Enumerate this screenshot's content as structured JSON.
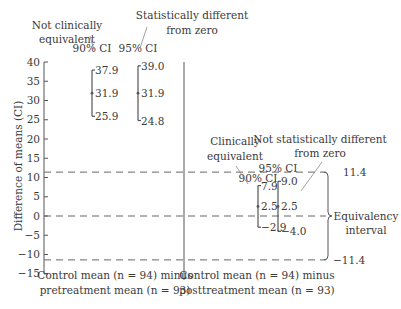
{
  "chart_data": {
    "type": "errorbar",
    "title": "",
    "xlabel": "",
    "ylabel": "Difference of means (CI)",
    "ylim": [
      -15,
      40
    ],
    "yticks": [
      40,
      35,
      30,
      25,
      20,
      15,
      10,
      5,
      0,
      -5,
      -10,
      -15
    ],
    "ytick_labels": [
      "40",
      "35",
      "30",
      "25",
      "20",
      "15",
      "10",
      "5",
      "0",
      "−5",
      "−10",
      "−15"
    ],
    "grid": false,
    "groups": [
      {
        "label_line1": "Control mean (n = 94) minus",
        "label_line2": "pretreatment mean (n = 93)",
        "intervals": [
          {
            "name": "90% CI",
            "upper": 37.9,
            "mean": 31.9,
            "lower": 25.9,
            "upper_label": "37.9",
            "mean_label": "31.9",
            "lower_label": "25.9"
          },
          {
            "name": "95% CI",
            "upper": 39.0,
            "mean": 31.9,
            "lower": 24.8,
            "upper_label": "39.0",
            "mean_label": "31.9",
            "lower_label": "24.8"
          }
        ],
        "annotations": [
          {
            "line1": "Not clinically",
            "line2": "equivalent",
            "points_to": "90% CI"
          },
          {
            "line1": "Statistically different",
            "line2": "from zero",
            "points_to": "95% CI"
          }
        ]
      },
      {
        "label_line1": "Control mean (n = 94) minus",
        "label_line2": "posttreatment mean (n = 93)",
        "intervals": [
          {
            "name": "90% CI",
            "upper": 7.9,
            "mean": 2.5,
            "lower": -2.9,
            "upper_label": "7.9",
            "mean_label": "2.5",
            "lower_label": "−2.9"
          },
          {
            "name": "95% CI",
            "upper": 9.0,
            "mean": 2.5,
            "lower": -4.0,
            "upper_label": "9.0",
            "mean_label": "2.5",
            "lower_label": "−4.0"
          }
        ],
        "annotations": [
          {
            "line1": "Clinically",
            "line2": "equivalent",
            "points_to": "90% CI"
          },
          {
            "line1": "Not statistically different",
            "line2": "from zero",
            "points_to": "95% CI"
          }
        ]
      }
    ],
    "reference_lines": [
      {
        "value": 11.4,
        "label": "11.4",
        "style": "dashed"
      },
      {
        "value": 0,
        "label": "",
        "style": "dashed"
      },
      {
        "value": -11.4,
        "label": "−11.4",
        "style": "dashed"
      }
    ],
    "equivalency_interval": {
      "lower": -11.4,
      "upper": 11.4,
      "label_line1": "Equivalency",
      "label_line2": "interval"
    }
  }
}
